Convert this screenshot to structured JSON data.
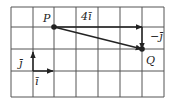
{
  "diagram": {
    "type": "vector-grid",
    "grid": {
      "columns": 7,
      "rows": 4,
      "x_lines": [
        11,
        33,
        54,
        76,
        98,
        120,
        142,
        164
      ],
      "y_lines": [
        7,
        27,
        49,
        71,
        97
      ],
      "line_color": "#555555"
    },
    "points": [
      {
        "name": "P",
        "label": "P",
        "x": 54,
        "y": 27,
        "label_x": 43,
        "label_y": 22
      },
      {
        "name": "Q",
        "label": "Q",
        "x": 142,
        "y": 49,
        "label_x": 146,
        "label_y": 64
      }
    ],
    "vectors": [
      {
        "name": "four-i",
        "label": "4ī",
        "x1": 54,
        "y1": 27,
        "x2": 142,
        "y2": 27,
        "label_x": 81,
        "label_y": 20
      },
      {
        "name": "minus-j",
        "label": "−j̄",
        "x1": 142,
        "y1": 27,
        "x2": 142,
        "y2": 49,
        "label_x": 150,
        "label_y": 40
      },
      {
        "name": "pq",
        "label": "",
        "x1": 54,
        "y1": 27,
        "x2": 142,
        "y2": 49
      },
      {
        "name": "unit-j",
        "label": "j̄",
        "x1": 33,
        "y1": 71,
        "x2": 33,
        "y2": 52,
        "label_x": 19,
        "label_y": 67
      },
      {
        "name": "unit-i",
        "label": "ī",
        "x1": 33,
        "y1": 71,
        "x2": 53,
        "y2": 71,
        "label_x": 35,
        "label_y": 85
      }
    ],
    "colors": {
      "stroke": "#222222",
      "background": "#ffffff"
    }
  }
}
